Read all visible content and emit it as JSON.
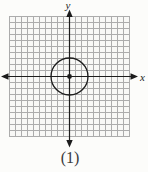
{
  "figure": {
    "caption": "(1)",
    "axis_labels": {
      "x": "x",
      "y": "y"
    },
    "grid": {
      "columns": 20,
      "rows": 20
    },
    "circle": {
      "center_units": [
        0,
        0
      ],
      "radius_grid_units": 3
    },
    "colors": {
      "axis": "#1c1c1c",
      "grid_line": "#acacac",
      "grid_background": "#f8f8f6",
      "page_background": "#fcfcfa",
      "circle": "#1c1c1c"
    }
  }
}
